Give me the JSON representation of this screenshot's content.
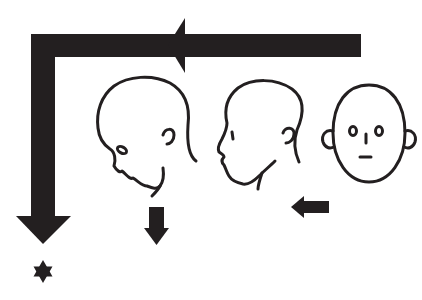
{
  "figure": {
    "colors": {
      "ink": "#231f20",
      "background": "#ffffff"
    },
    "elements": {
      "main_arrow": {
        "shape": "L-arrow",
        "direction": "left-then-down"
      },
      "heads": [
        {
          "id": "head-front",
          "view": "frontal",
          "position": "right"
        },
        {
          "id": "head-profile",
          "view": "left profile",
          "position": "middle"
        },
        {
          "id": "head-tilted",
          "view": "profile tilted back",
          "position": "left"
        }
      ],
      "small_arrows": [
        {
          "id": "arrow-left-small",
          "direction": "left"
        },
        {
          "id": "arrow-down-small",
          "direction": "down"
        }
      ],
      "marker": {
        "shape": "six-pointed star"
      }
    }
  }
}
